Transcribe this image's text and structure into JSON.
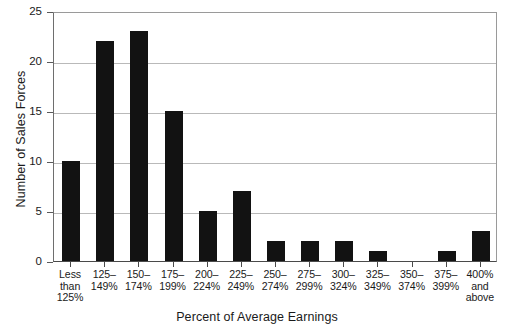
{
  "chart_data": {
    "type": "bar",
    "title": "",
    "xlabel": "Percent of Average Earnings",
    "ylabel": "Number of Sales Forces",
    "categories": [
      "Less\nthan\n125%",
      "125–\n149%",
      "150–\n174%",
      "175–\n199%",
      "200–\n224%",
      "225–\n249%",
      "250–\n274%",
      "275–\n299%",
      "300–\n324%",
      "325–\n349%",
      "350–\n374%",
      "375–\n399%",
      "400%\nand\nabove"
    ],
    "values": [
      10,
      22,
      23,
      15,
      5,
      7,
      2,
      2,
      2,
      1,
      0,
      1,
      3
    ],
    "ylim": [
      0,
      25
    ],
    "yticks": [
      0,
      5,
      10,
      15,
      20,
      25
    ],
    "ytick_labels": [
      "0",
      "5",
      "10",
      "15",
      "20",
      "25"
    ],
    "grid": true,
    "legend": false,
    "bar_color": "#121212",
    "grid_color": "#b9b9b9",
    "axis_color": "#4a4a4a",
    "background": "#ffffff"
  }
}
